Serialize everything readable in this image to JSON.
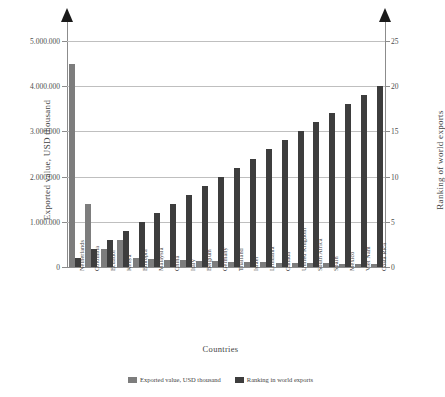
{
  "chart_data": {
    "type": "bar",
    "title": "",
    "xlabel": "Countries",
    "ylabel": "Exported value, USD thousand",
    "y2label": "Ranking of world exports",
    "categories": [
      "Netherlands",
      "Colombia",
      "Ecuador",
      "Kenya",
      "Ethiopia",
      "Malaysia",
      "China",
      "Italy",
      "Belgium",
      "Germany",
      "Thailand",
      "Israel",
      "Lithuania",
      "Canada",
      "United Kingdom",
      "South Africa",
      "Spain",
      "Mexico",
      "Viet Nam",
      "Costa Rica"
    ],
    "series": [
      {
        "name": "Exported value, USD thousand",
        "axis": "left",
        "color": "#7d7d7d",
        "values": [
          4500000,
          1400000,
          400000,
          600000,
          200000,
          180000,
          160000,
          150000,
          140000,
          130000,
          120000,
          110000,
          100000,
          95000,
          90000,
          85000,
          80000,
          75000,
          70000,
          65000
        ]
      },
      {
        "name": "Ranking in world exports",
        "axis": "right",
        "color": "#3d3d3d",
        "values": [
          1,
          2,
          3,
          4,
          5,
          6,
          7,
          8,
          9,
          10,
          11,
          12,
          13,
          14,
          15,
          16,
          17,
          18,
          19,
          20
        ]
      }
    ],
    "ylim": [
      0,
      5000000
    ],
    "yticks": [
      "0",
      "1.000.000",
      "2.000.000",
      "3.000.000",
      "4.000.000",
      "5.000.000"
    ],
    "ytick_values": [
      0,
      1000000,
      2000000,
      3000000,
      4000000,
      5000000
    ],
    "y2lim": [
      0,
      25
    ],
    "y2ticks": [
      "0",
      "5",
      "10",
      "15",
      "20",
      "25"
    ],
    "y2tick_values": [
      0,
      5,
      10,
      15,
      20,
      25
    ],
    "grid": true,
    "legend_position": "bottom"
  },
  "legend": {
    "items": [
      {
        "label": "Exported value, USD thousand"
      },
      {
        "label": "Ranking in world exports"
      }
    ]
  }
}
